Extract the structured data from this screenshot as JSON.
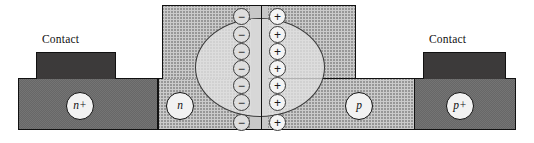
{
  "figure": {
    "kind": "semiconductor-cross-section"
  },
  "labels": {
    "contact_left": "Contact",
    "contact_right": "Contact",
    "region_n_plus": "n+",
    "region_n": "n",
    "region_p": "p",
    "region_p_plus": "p+"
  },
  "charges": {
    "negative_symbol": "−",
    "positive_symbol": "+",
    "negative_count": 7,
    "positive_count": 7,
    "negative_side": "n-side of junction",
    "positive_side": "p-side of junction"
  },
  "colors": {
    "metal_contact": "#3c3a3a",
    "heavy_doped_fill": "#9b9b9b",
    "light_doped_fill": "#cbcbcb",
    "depletion_fill": "#e1e1e1",
    "junction_strip": "#c8c8c8",
    "outline": "#111111",
    "bubble_fill": "#f2f2f2"
  },
  "geometry": {
    "canvas_width": 534,
    "canvas_height": 143,
    "mesa_left": 162,
    "mesa_right": 356,
    "mesa_top": 5,
    "step_y": 78,
    "base_bottom": 130
  }
}
